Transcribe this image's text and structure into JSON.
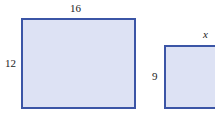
{
  "figure": {
    "shapes": [
      {
        "name": "large-rectangle",
        "width_label": "16",
        "height_label": "12"
      },
      {
        "name": "small-rectangle",
        "width_label": "x",
        "height_label": "9"
      }
    ],
    "colors": {
      "stroke": "#3b55a6",
      "fill": "#dde2f4"
    }
  }
}
